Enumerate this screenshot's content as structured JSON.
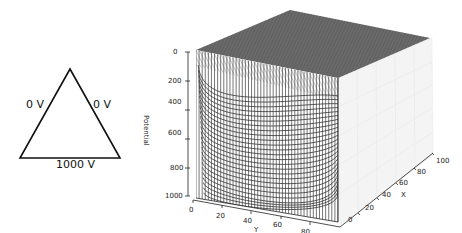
{
  "diagram": {
    "shape": "equilateral-triangle",
    "left_side_label": "0 V",
    "right_side_label": "0 V",
    "bottom_side_label": "1000 V"
  },
  "chart_data": {
    "type": "surface-3d-wireframe",
    "title": "",
    "xlabel": "X",
    "ylabel": "Y",
    "zlabel": "Potential",
    "x_ticks": [
      "0",
      "20",
      "40",
      "60",
      "80",
      "100"
    ],
    "y_ticks": [
      "0",
      "20",
      "40",
      "60",
      "80",
      "100"
    ],
    "z_ticks": [
      "0",
      "200",
      "400",
      "600",
      "800",
      "1000"
    ],
    "xlim": [
      0,
      100
    ],
    "ylim": [
      0,
      100
    ],
    "zlim": [
      1000,
      0
    ],
    "z_axis_inverted": true,
    "grid": true,
    "surface_color": "#555555",
    "line_color": "#333333"
  }
}
